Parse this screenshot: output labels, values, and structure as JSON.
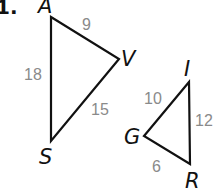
{
  "problem": {
    "number": "1."
  },
  "triangles": [
    {
      "name": "triangle-AVS",
      "vertices": [
        {
          "label": "A",
          "x": 51,
          "y": 17
        },
        {
          "label": "V",
          "x": 119,
          "y": 59
        },
        {
          "label": "S",
          "x": 51,
          "y": 141
        }
      ],
      "sides": [
        {
          "between": "AV",
          "length": "9"
        },
        {
          "between": "AS",
          "length": "18"
        },
        {
          "between": "VS",
          "length": "15"
        }
      ]
    },
    {
      "name": "triangle-IGR",
      "vertices": [
        {
          "label": "I",
          "x": 189,
          "y": 82
        },
        {
          "label": "G",
          "x": 144,
          "y": 136
        },
        {
          "label": "R",
          "x": 190,
          "y": 164
        }
      ],
      "sides": [
        {
          "between": "GI",
          "length": "10"
        },
        {
          "between": "IR",
          "length": "12"
        },
        {
          "between": "GR",
          "length": "6"
        }
      ]
    }
  ],
  "colors": {
    "line": "#111111",
    "side_label": "#8a8a8a"
  }
}
